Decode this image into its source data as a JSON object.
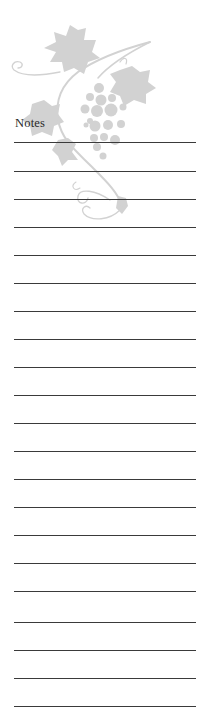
{
  "page": {
    "title": "Notes",
    "ornament": "grapevine-icon",
    "line_count": 21,
    "line_positions": [
      142,
      171,
      199,
      227,
      255,
      283,
      311,
      339,
      367,
      395,
      423,
      451,
      479,
      507,
      535,
      563,
      591,
      622,
      650,
      678,
      706
    ],
    "colors": {
      "background": "#ffffff",
      "ornament": "#cfcfcf",
      "rule": "#3a3a3a",
      "text": "#2a2a2a"
    }
  }
}
